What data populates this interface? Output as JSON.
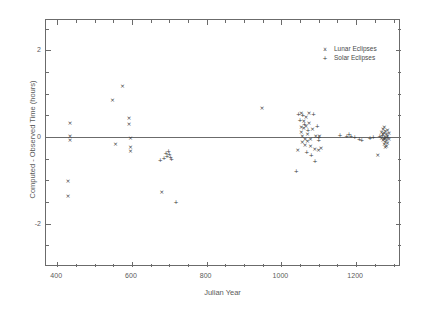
{
  "chart_data": {
    "type": "scatter",
    "title": "",
    "xlabel": "Julian Year",
    "ylabel": "Computed  -  Observed Time (hours)",
    "xlim": [
      370,
      1320
    ],
    "ylim": [
      -3.0,
      2.7
    ],
    "xticks": [
      400,
      600,
      800,
      1000,
      1200
    ],
    "yticks": [
      2,
      0,
      -2
    ],
    "xtick_labels": [
      "400",
      "600",
      "800",
      "1000",
      "1200"
    ],
    "ytick_labels": [
      "2",
      "0",
      "-2"
    ],
    "xminor_step": 50,
    "yminor_step": 0.5,
    "grid": false,
    "zero_reference_line": 0,
    "legend_position": "top-right",
    "legend": [
      {
        "label": "Lunar Eclipses",
        "marker": "x"
      },
      {
        "label": "Solar Eclipses",
        "marker": "+"
      }
    ],
    "series": [
      {
        "name": "Lunar Eclipses",
        "marker": "x",
        "points": [
          [
            429,
            -1.02
          ],
          [
            429,
            -1.35
          ],
          [
            434,
            0.33
          ],
          [
            434,
            0.03
          ],
          [
            434,
            -0.08
          ],
          [
            548,
            0.86
          ],
          [
            556,
            -0.17
          ],
          [
            575,
            1.17
          ],
          [
            592,
            0.31
          ],
          [
            592,
            0.44
          ],
          [
            596,
            -0.02
          ],
          [
            596,
            -0.22
          ],
          [
            596,
            -0.33
          ],
          [
            680,
            -1.28
          ],
          [
            948,
            0.68
          ],
          [
            1044,
            -0.3
          ],
          [
            1053,
            0.55
          ],
          [
            1053,
            0.24
          ],
          [
            1053,
            0.12
          ],
          [
            1056,
            0.02
          ],
          [
            1056,
            -0.12
          ],
          [
            1060,
            0.36
          ],
          [
            1060,
            0.2
          ],
          [
            1063,
            -0.05
          ],
          [
            1063,
            -0.18
          ],
          [
            1066,
            0.46
          ],
          [
            1066,
            0.25
          ],
          [
            1070,
            0.06
          ],
          [
            1070,
            -0.1
          ],
          [
            1074,
            0.32
          ],
          [
            1074,
            0.55
          ],
          [
            1078,
            -0.04
          ],
          [
            1078,
            -0.2
          ],
          [
            1083,
            0.18
          ],
          [
            1089,
            -0.28
          ],
          [
            1092,
            0.03
          ],
          [
            1099,
            -0.3
          ],
          [
            1102,
            0.02
          ],
          [
            1106,
            -0.26
          ],
          [
            1258,
            -0.42
          ],
          [
            1268,
            0.12
          ],
          [
            1268,
            -0.02
          ],
          [
            1272,
            0.18
          ],
          [
            1272,
            0.06
          ],
          [
            1272,
            -0.08
          ],
          [
            1275,
            0.22
          ],
          [
            1275,
            0.1
          ],
          [
            1275,
            -0.05
          ],
          [
            1275,
            -0.16
          ],
          [
            1278,
            0.14
          ],
          [
            1278,
            0.0
          ],
          [
            1278,
            -0.12
          ],
          [
            1278,
            -0.24
          ],
          [
            1281,
            0.08
          ],
          [
            1281,
            -0.06
          ],
          [
            1281,
            -0.2
          ],
          [
            1284,
            0.16
          ],
          [
            1284,
            0.02
          ],
          [
            1284,
            -0.14
          ],
          [
            1288,
            0.1
          ],
          [
            1288,
            -0.04
          ]
        ]
      },
      {
        "name": "Solar Eclipses",
        "marker": "+",
        "points": [
          [
            676,
            -0.52
          ],
          [
            686,
            -0.48
          ],
          [
            691,
            -0.38
          ],
          [
            694,
            -0.44
          ],
          [
            698,
            -0.33
          ],
          [
            700,
            -0.4
          ],
          [
            703,
            -0.46
          ],
          [
            706,
            -0.5
          ],
          [
            718,
            -1.5
          ],
          [
            1040,
            -0.78
          ],
          [
            1046,
            0.54
          ],
          [
            1050,
            0.4
          ],
          [
            1057,
            0.5
          ],
          [
            1062,
            0.3
          ],
          [
            1068,
            -0.35
          ],
          [
            1071,
            0.16
          ],
          [
            1080,
            -0.42
          ],
          [
            1086,
            0.52
          ],
          [
            1090,
            -0.55
          ],
          [
            1096,
            0.26
          ],
          [
            1100,
            0.0
          ],
          [
            1100,
            -0.08
          ],
          [
            1157,
            0.04
          ],
          [
            1175,
            0.02
          ],
          [
            1181,
            0.06
          ],
          [
            1186,
            0.03
          ],
          [
            1196,
            0.0
          ],
          [
            1208,
            -0.04
          ],
          [
            1215,
            -0.06
          ],
          [
            1237,
            -0.03
          ],
          [
            1246,
            0.01
          ],
          [
            1263,
            0.02
          ],
          [
            1270,
            0.04
          ],
          [
            1276,
            -0.02
          ],
          [
            1283,
            0.0
          ]
        ]
      }
    ]
  }
}
